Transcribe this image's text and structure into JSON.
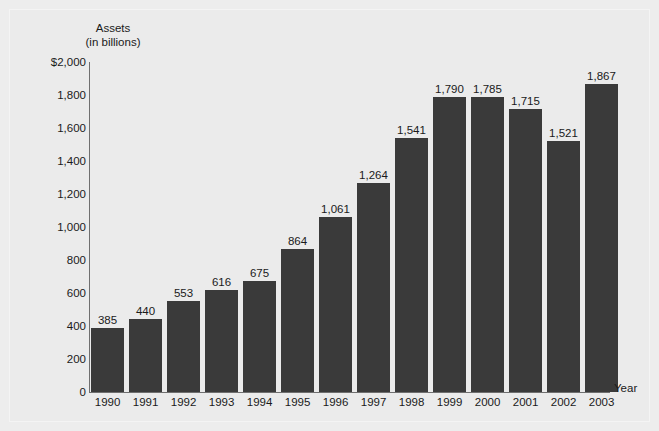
{
  "chart_data": {
    "type": "bar",
    "title": "",
    "ylabel": "Assets\n(in billions)",
    "ylabel_lines": [
      "Assets",
      "(in billions)"
    ],
    "xlabel": "Year",
    "categories": [
      "1990",
      "1991",
      "1992",
      "1993",
      "1994",
      "1995",
      "1996",
      "1997",
      "1998",
      "1999",
      "2000",
      "2001",
      "2002",
      "2003"
    ],
    "values": [
      385,
      440,
      553,
      616,
      675,
      864,
      1061,
      1264,
      1541,
      1790,
      1785,
      1715,
      1521,
      1867
    ],
    "value_labels": [
      "385",
      "440",
      "553",
      "616",
      "675",
      "864",
      "1,061",
      "1,264",
      "1,541",
      "1,790",
      "1,785",
      "1,715",
      "1,521",
      "1,867"
    ],
    "ylim": [
      0,
      2000
    ],
    "ytick_values": [
      0,
      200,
      400,
      600,
      800,
      1000,
      1200,
      1400,
      1600,
      1800,
      2000
    ],
    "ytick_labels": [
      "0",
      "200",
      "400",
      "600",
      "800",
      "1,000",
      "1,200",
      "1,400",
      "1,600",
      "1,800",
      "$2,000"
    ],
    "grid": false,
    "legend": null,
    "bar_color": "#3a3a3a",
    "background_color": "#ebebeb",
    "axis_color": "#6f6f6f",
    "text_color": "#1a1a1a"
  }
}
